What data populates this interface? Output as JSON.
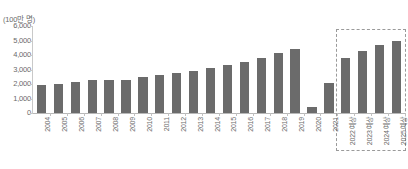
{
  "chart_data": {
    "type": "bar",
    "title": "",
    "subtitle": "",
    "unit_label": "(100만 명)",
    "xlabel": "",
    "ylabel": "",
    "ylim": [
      0,
      6000
    ],
    "ytick_values": [
      0,
      1000,
      2000,
      3000,
      4000,
      5000,
      6000
    ],
    "ytick_labels": [
      "0",
      "1,000",
      "2,000",
      "3,000",
      "4,000",
      "5,000",
      "6,000"
    ],
    "grid": false,
    "legend": null,
    "bar_color": "#6b6b6b",
    "axis_color": "#c9c9c9",
    "forecast_box_color": "#9a9a9a",
    "categories": [
      "2004",
      "2005",
      "2006",
      "2007",
      "2008",
      "2009",
      "2010",
      "2011",
      "2012",
      "2013",
      "2014",
      "2015",
      "2016",
      "2017",
      "2018",
      "2019",
      "2020",
      "2021",
      "2022 예상",
      "2023 예상",
      "2024 예상",
      "2025 예상"
    ],
    "values": [
      1900,
      2020,
      2120,
      2300,
      2300,
      2250,
      2500,
      2620,
      2750,
      2900,
      3100,
      3300,
      3550,
      3800,
      4150,
      4400,
      420,
      2050,
      3800,
      4300,
      4700,
      5000
    ],
    "annotations": [
      {
        "name": "forecast-region",
        "label": "예상 (forecast)",
        "from_category": "2022 예상",
        "to_category": "2025 예상",
        "style": "dashed-rectangle"
      }
    ]
  },
  "footnote": {
    "text": ""
  }
}
